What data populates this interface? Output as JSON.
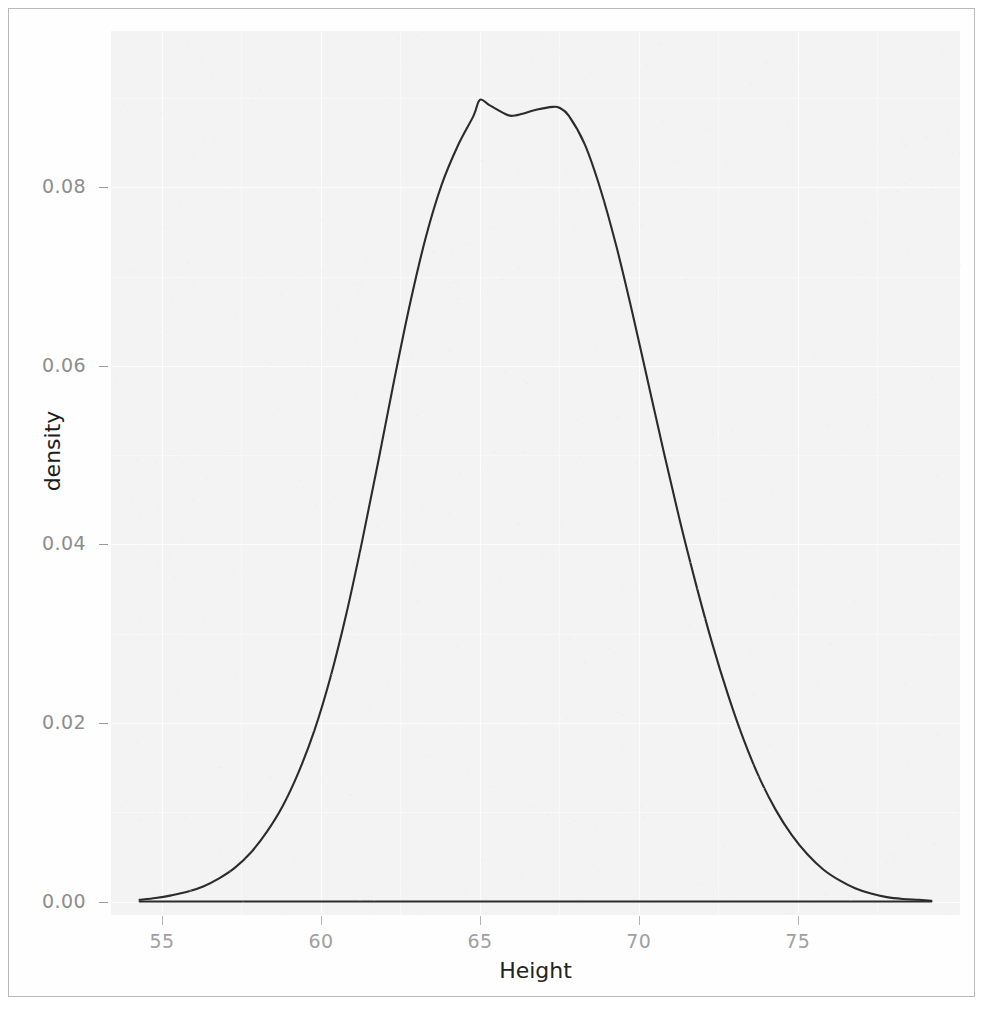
{
  "figure": {
    "kind": "density-plot",
    "background": "#ffffff",
    "panel_background": "#f3f3f3",
    "grid_major_color": "#fcfcfc",
    "grid_minor_color": "#f8f8f8",
    "line_color": "#2b2b2b",
    "tick_label_color": "#999999",
    "axis_title_color": "#1c1c1c"
  },
  "axes": {
    "x": {
      "label": "Height",
      "ticks": [
        "55",
        "60",
        "70",
        "75"
      ],
      "tick_values": [
        55,
        60,
        65,
        70,
        75
      ],
      "tick_labels": [
        "55",
        "60",
        "65",
        "70",
        "75"
      ],
      "range": [
        53.4,
        80.1
      ]
    },
    "y": {
      "label": "density",
      "tick_values": [
        0.0,
        0.02,
        0.04,
        0.06,
        0.08
      ],
      "tick_labels": [
        "0.00",
        "0.02",
        "0.04",
        "0.06",
        "0.08"
      ],
      "range": [
        -0.0015,
        0.0975
      ]
    }
  },
  "chart_data": {
    "type": "line",
    "title": "",
    "subtitle": "",
    "xlabel": "Height",
    "ylabel": "density",
    "xlim": [
      53.4,
      80.1
    ],
    "ylim": [
      -0.0015,
      0.0975
    ],
    "xticks": [
      55,
      60,
      65,
      70,
      75
    ],
    "yticks": [
      0.0,
      0.02,
      0.04,
      0.06,
      0.08
    ],
    "grid": true,
    "legend": "none",
    "annotations": [],
    "series": [
      {
        "name": "density",
        "kind": "kernel-density",
        "color": "#2b2b2b",
        "x": [
          54.3,
          54.8,
          55.3,
          55.8,
          56.3,
          56.8,
          57.3,
          57.8,
          58.3,
          58.8,
          59.3,
          59.8,
          60.3,
          60.8,
          61.3,
          61.8,
          62.3,
          62.8,
          63.3,
          63.8,
          64.3,
          64.8,
          65.0,
          65.3,
          65.8,
          66.0,
          66.3,
          66.8,
          67.3,
          67.5,
          67.8,
          68.3,
          68.8,
          69.3,
          69.8,
          70.3,
          70.8,
          71.3,
          71.8,
          72.3,
          72.8,
          73.3,
          73.8,
          74.3,
          74.8,
          75.3,
          75.8,
          76.3,
          76.8,
          77.3,
          77.8,
          78.3,
          78.8,
          79.2
        ],
        "y": [
          0.0002,
          0.0004,
          0.0007,
          0.0011,
          0.0017,
          0.0026,
          0.0038,
          0.0055,
          0.0078,
          0.0107,
          0.0145,
          0.0192,
          0.0251,
          0.0322,
          0.0404,
          0.0492,
          0.0583,
          0.0669,
          0.0744,
          0.0803,
          0.0846,
          0.088,
          0.0898,
          0.0892,
          0.0882,
          0.088,
          0.0882,
          0.0887,
          0.089,
          0.0889,
          0.088,
          0.0848,
          0.0797,
          0.0733,
          0.0659,
          0.058,
          0.0501,
          0.0425,
          0.0355,
          0.029,
          0.0232,
          0.0181,
          0.0138,
          0.0103,
          0.0075,
          0.0053,
          0.0036,
          0.0024,
          0.0015,
          0.0009,
          0.0005,
          0.0003,
          0.0002,
          0.0001
        ]
      },
      {
        "name": "baseline",
        "kind": "reference-line",
        "color": "#2b2b2b",
        "x": [
          54.3,
          79.2
        ],
        "y": [
          0.0,
          0.0
        ]
      }
    ],
    "peak": {
      "x": 65.0,
      "y": 0.0898
    },
    "secondary_peak": {
      "x": 67.4,
      "y": 0.089
    },
    "dip": {
      "x": 66.0,
      "y": 0.088
    }
  }
}
